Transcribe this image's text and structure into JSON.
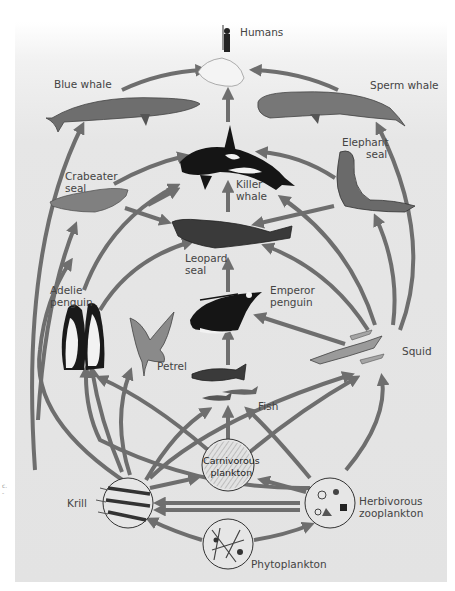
{
  "diagram": {
    "colors": {
      "background": "#e4e4e4",
      "arrow": "#6e6e6e",
      "organism_dark": "#1a1a1a",
      "label_text": "#444444"
    },
    "nodes": [
      {
        "id": "humans",
        "label": "Humans"
      },
      {
        "id": "blue_whale",
        "label": "Blue whale"
      },
      {
        "id": "sperm_whale",
        "label": "Sperm whale"
      },
      {
        "id": "killer_whale",
        "label": "Killer\nwhale",
        "line1": "Killer",
        "line2": "whale"
      },
      {
        "id": "elephant_seal",
        "label": "Elephant seal",
        "line1": "Elephant",
        "line2": "seal"
      },
      {
        "id": "crabeater_seal",
        "label": "Crabeater seal",
        "line1": "Crabeater",
        "line2": "seal"
      },
      {
        "id": "leopard_seal",
        "label": "Leopard seal",
        "line1": "Leopard",
        "line2": "seal"
      },
      {
        "id": "adelie_penguin",
        "label": "Adelie penguin",
        "line1": "Adelie",
        "line2": "penguin"
      },
      {
        "id": "emperor_penguin",
        "label": "Emperor penguin",
        "line1": "Emperor",
        "line2": "penguin"
      },
      {
        "id": "petrel",
        "label": "Petrel"
      },
      {
        "id": "squid",
        "label": "Squid"
      },
      {
        "id": "fish",
        "label": "Fish"
      },
      {
        "id": "carnivorous_plankton",
        "label": "Carnivorous plankton",
        "line1": "Carnivorous",
        "line2": "plankton"
      },
      {
        "id": "krill",
        "label": "Krill"
      },
      {
        "id": "herbivorous_zooplankton",
        "label": "Herbivorous zooplankton",
        "line1": "Herbivorous",
        "line2": "zooplankton"
      },
      {
        "id": "phytoplankton",
        "label": "Phytoplankton"
      }
    ],
    "edges": [
      [
        "blue_whale",
        "humans"
      ],
      [
        "sperm_whale",
        "humans"
      ],
      [
        "killer_whale",
        "humans"
      ],
      [
        "krill",
        "blue_whale"
      ],
      [
        "squid",
        "sperm_whale"
      ],
      [
        "crabeater_seal",
        "killer_whale"
      ],
      [
        "adelie_penguin",
        "killer_whale"
      ],
      [
        "elephant_seal",
        "killer_whale"
      ],
      [
        "leopard_seal",
        "killer_whale"
      ],
      [
        "squid",
        "killer_whale"
      ],
      [
        "krill",
        "crabeater_seal"
      ],
      [
        "squid",
        "elephant_seal"
      ],
      [
        "crabeater_seal",
        "leopard_seal"
      ],
      [
        "elephant_seal",
        "leopard_seal"
      ],
      [
        "adelie_penguin",
        "leopard_seal"
      ],
      [
        "emperor_penguin",
        "leopard_seal"
      ],
      [
        "squid",
        "leopard_seal"
      ],
      [
        "squid",
        "emperor_penguin"
      ],
      [
        "fish",
        "emperor_penguin"
      ],
      [
        "krill",
        "adelie_penguin"
      ],
      [
        "carnivorous_plankton",
        "adelie_penguin"
      ],
      [
        "herbivorous_zooplankton",
        "adelie_penguin"
      ],
      [
        "krill",
        "petrel"
      ],
      [
        "krill",
        "fish"
      ],
      [
        "carnivorous_plankton",
        "fish"
      ],
      [
        "herbivorous_zooplankton",
        "fish"
      ],
      [
        "krill",
        "squid"
      ],
      [
        "carnivorous_plankton",
        "squid"
      ],
      [
        "herbivorous_zooplankton",
        "squid"
      ],
      [
        "krill",
        "carnivorous_plankton"
      ],
      [
        "herbivorous_zooplankton",
        "carnivorous_plankton"
      ],
      [
        "herbivorous_zooplankton",
        "krill"
      ],
      [
        "phytoplankton",
        "krill"
      ],
      [
        "phytoplankton",
        "herbivorous_zooplankton"
      ]
    ]
  },
  "margin_text": {
    "line1": "c.",
    "line2": "-"
  }
}
